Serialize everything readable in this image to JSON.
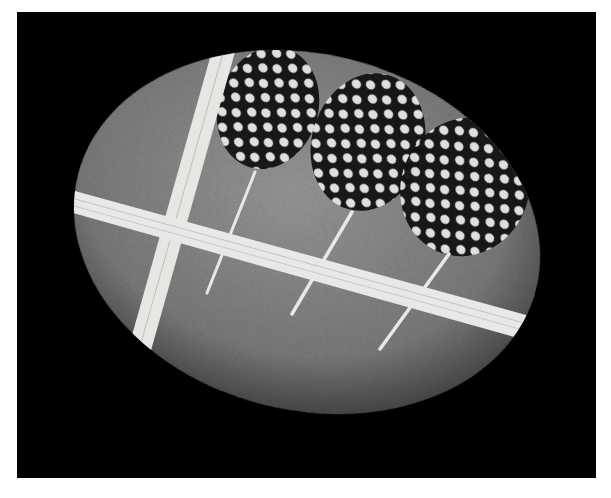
{
  "image": {
    "description": "Black and white photograph of a smooth oval stone wrapped with twine, with three spotted guinea fowl feathers tucked under the twine",
    "background_color": "#000000",
    "border_color": "#ffffff"
  },
  "stone": {
    "color": "#8a8a8a",
    "shadow_color": "#3a3a3a",
    "cx": 307,
    "cy": 232,
    "rx": 236,
    "ry": 178,
    "rotation": 14
  },
  "twine": {
    "color": "#e8e8e6",
    "vertical_band": {
      "x1": 215,
      "y1": 40,
      "x2": 130,
      "y2": 352
    },
    "horizontal_band": {
      "x1": 55,
      "y1": 188,
      "x2": 515,
      "y2": 328
    }
  },
  "feathers": [
    {
      "label": "left-feather",
      "cx": 268,
      "cy": 108,
      "rx": 50,
      "ry": 60,
      "quill_end_x": 207,
      "quill_end_y": 293
    },
    {
      "label": "middle-feather",
      "cx": 368,
      "cy": 142,
      "rx": 56,
      "ry": 68,
      "quill_end_x": 292,
      "quill_end_y": 314
    },
    {
      "label": "right-feather",
      "cx": 463,
      "cy": 186,
      "rx": 62,
      "ry": 68,
      "quill_end_x": 380,
      "quill_end_y": 349
    }
  ],
  "feather_colors": {
    "base": "#111111",
    "spot": "#e6e6e6"
  }
}
